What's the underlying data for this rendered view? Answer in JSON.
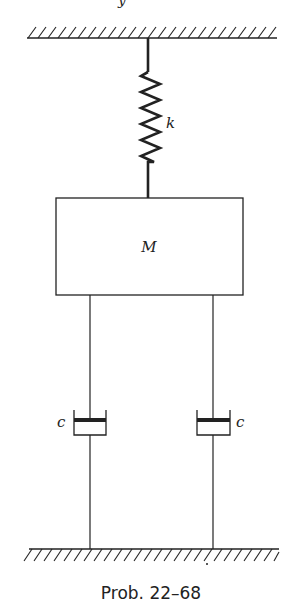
{
  "figure": {
    "caption": "Prob. 22–68",
    "top_fragment": "y"
  },
  "elements": {
    "spring": {
      "label": "k"
    },
    "mass": {
      "label": "M"
    },
    "dashpot_left": {
      "label": "c"
    },
    "dashpot_right": {
      "label": "c"
    }
  },
  "colors": {
    "ink": "#222222",
    "background": "#ffffff"
  }
}
